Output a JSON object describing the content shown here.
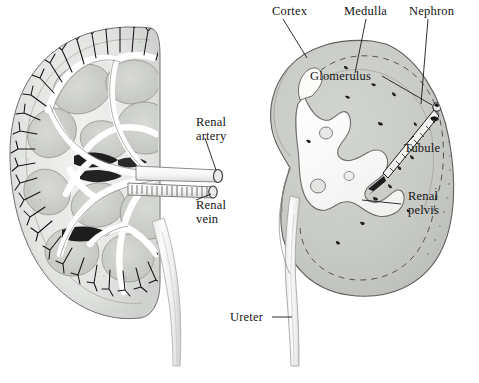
{
  "figure": {
    "background_color": "#ffffff",
    "palette": {
      "ink": "#1a1a1a",
      "parenchyma_grey": "#c9cbc7",
      "medulla_grey": "#c2c4c0",
      "light_grey": "#dcdedb",
      "pale_grey": "#e9eae8",
      "vessel_white": "#fbfbfb",
      "dark_shadow": "#2b2b2b"
    }
  },
  "labels": {
    "renal_artery": "Renal\nartery",
    "renal_artery_line1": "Renal",
    "renal_artery_line2": "artery",
    "renal_vein_line1": "Renal",
    "renal_vein_line2": "vein",
    "cortex": "Cortex",
    "medulla": "Medulla",
    "nephron": "Nephron",
    "glomerulus": "Glomerulus",
    "tubule": "Tubule",
    "renal_pelvis_line1": "Renal",
    "renal_pelvis_line2": "pelvis",
    "ureter": "Ureter"
  },
  "panels": {
    "left": {
      "name": "vascular-cast-view",
      "description": "Kidney cut-away showing branching renal vasculature, cortical arcades and pyramids"
    },
    "right": {
      "name": "gross-section-view",
      "description": "Kidney longitudinal section showing cortex, medulla, renal pelvis, nephron detail and ureter"
    }
  }
}
